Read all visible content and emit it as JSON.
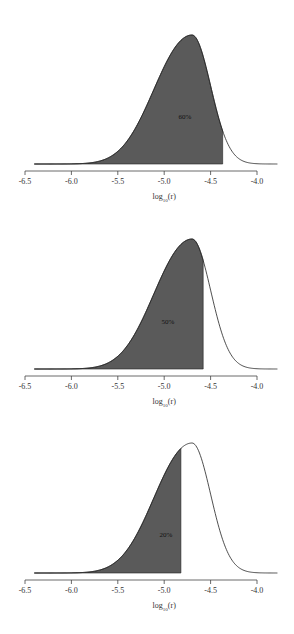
{
  "chart_data": [
    {
      "type": "area",
      "title": "",
      "xlabel": "log10(r)",
      "xlabel_base": "log",
      "xlabel_sub": "10",
      "xlabel_arg": "(r)",
      "ylabel": "",
      "xlim": [
        -6.5,
        -4.0
      ],
      "ticks": [
        -6.5,
        -6.0,
        -5.5,
        -5.0,
        -4.5,
        -4.0
      ],
      "tick_labels": [
        "-6.5",
        "-6.0",
        "-5.5",
        "-5.0",
        "-4.5",
        "-4.0"
      ],
      "curve": {
        "start": -6.4,
        "end": -3.78,
        "mode": -4.7,
        "skew": "left"
      },
      "shaded_from": -6.4,
      "shaded_to": -4.37,
      "shaded_fraction": 0.6,
      "annotation": "60%",
      "grid": false
    },
    {
      "type": "area",
      "title": "",
      "xlabel": "log10(r)",
      "xlabel_base": "log",
      "xlabel_sub": "10",
      "xlabel_arg": "(r)",
      "ylabel": "",
      "xlim": [
        -6.5,
        -4.0
      ],
      "ticks": [
        -6.5,
        -6.0,
        -5.5,
        -5.0,
        -4.5,
        -4.0
      ],
      "tick_labels": [
        "-6.5",
        "-6.0",
        "-5.5",
        "-5.0",
        "-4.5",
        "-4.0"
      ],
      "curve": {
        "start": -6.4,
        "end": -3.78,
        "mode": -4.7,
        "skew": "left"
      },
      "shaded_from": -6.4,
      "shaded_to": -4.58,
      "shaded_fraction": 0.5,
      "annotation": "50%",
      "grid": false
    },
    {
      "type": "area",
      "title": "",
      "xlabel": "log10(r)",
      "xlabel_base": "log",
      "xlabel_sub": "10",
      "xlabel_arg": "(r)",
      "ylabel": "",
      "xlim": [
        -6.5,
        -4.0
      ],
      "ticks": [
        -6.5,
        -6.0,
        -5.5,
        -5.0,
        -4.5,
        -4.0
      ],
      "tick_labels": [
        "-6.5",
        "-6.0",
        "-5.5",
        "-5.0",
        "-4.5",
        "-4.0"
      ],
      "curve": {
        "start": -6.4,
        "end": -3.78,
        "mode": -4.7,
        "skew": "left"
      },
      "shaded_from": -6.4,
      "shaded_to": -4.82,
      "shaded_fraction": 0.2,
      "annotation": "20%",
      "grid": false
    }
  ],
  "colors": {
    "fill": "#5a5a5a",
    "line": "#222222",
    "axis": "#444444",
    "text": "#333333"
  },
  "layout": {
    "panels": [
      {
        "top": 0,
        "baseline": 164,
        "peak_y": 35,
        "axis_y": 171,
        "label_x": 185,
        "label_y": 117
      },
      {
        "top": 0,
        "baseline": 369,
        "peak_y": 239,
        "axis_y": 376,
        "label_x": 168,
        "label_y": 322
      },
      {
        "top": 0,
        "baseline": 573,
        "peak_y": 443,
        "axis_y": 580,
        "label_x": 166,
        "label_y": 535
      }
    ]
  }
}
